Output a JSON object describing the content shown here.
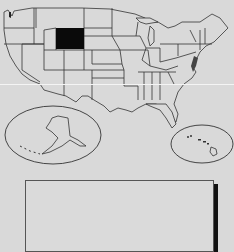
{
  "map": {
    "title": "",
    "subject": "United States",
    "highlighted_state": "Wyoming",
    "colors": {
      "background": "#d9d9d9",
      "state_fill": "#d9d9d9",
      "state_border": "#333333",
      "highlight_fill": "#0a0a0a",
      "coast_dark": "#444444"
    },
    "insets": [
      {
        "name": "Alaska",
        "shape": "oval"
      },
      {
        "name": "Hawaii",
        "shape": "oval"
      }
    ],
    "legend_box": {
      "label": "",
      "content": ""
    }
  }
}
